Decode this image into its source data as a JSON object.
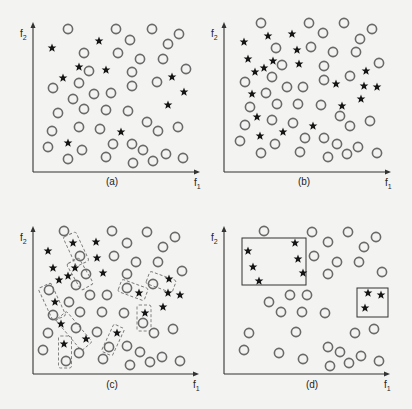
{
  "figure": {
    "panels": [
      {
        "id": "a",
        "caption": "(a)",
        "caption_pos": [
          112,
          185
        ],
        "axes": {
          "x0": 33,
          "y0": 172,
          "xend": 200,
          "ytop": 22,
          "xlabel": "f",
          "xlabel_sub": "1",
          "ylabel": "f",
          "ylabel_sub": "2"
        },
        "circles": [
          [
            68,
            29
          ],
          [
            116,
            29
          ],
          [
            152,
            29
          ],
          [
            179,
            34
          ],
          [
            130,
            40
          ],
          [
            168,
            44
          ],
          [
            84,
            53
          ],
          [
            118,
            53
          ],
          [
            140,
            59
          ],
          [
            163,
            59
          ],
          [
            186,
            69
          ],
          [
            89,
            71
          ],
          [
            132,
            72
          ],
          [
            53,
            88
          ],
          [
            79,
            83
          ],
          [
            132,
            86
          ],
          [
            157,
            82
          ],
          [
            94,
            94
          ],
          [
            111,
            93
          ],
          [
            73,
            99
          ],
          [
            58,
            113
          ],
          [
            84,
            109
          ],
          [
            106,
            110
          ],
          [
            128,
            111
          ],
          [
            147,
            122
          ],
          [
            52,
            131
          ],
          [
            79,
            127
          ],
          [
            100,
            129
          ],
          [
            158,
            131
          ],
          [
            178,
            127
          ],
          [
            48,
            147
          ],
          [
            82,
            150
          ],
          [
            113,
            144
          ],
          [
            132,
            144
          ],
          [
            143,
            150
          ],
          [
            68,
            159
          ],
          [
            106,
            157
          ],
          [
            133,
            163
          ],
          [
            153,
            161
          ],
          [
            166,
            154
          ],
          [
            183,
            158
          ]
        ],
        "stars": [
          [
            52,
            48
          ],
          [
            99,
            41
          ],
          [
            79,
            67
          ],
          [
            106,
            70
          ],
          [
            63,
            78
          ],
          [
            172,
            77
          ],
          [
            184,
            92
          ],
          [
            168,
            105
          ],
          [
            121,
            132
          ],
          [
            68,
            143
          ]
        ],
        "boxes": [],
        "dashed_boxes": []
      },
      {
        "id": "b",
        "caption": "(b)",
        "caption_pos": [
          304,
          185
        ],
        "axes": {
          "x0": 224,
          "y0": 172,
          "xend": 391,
          "ytop": 22,
          "xlabel": "f",
          "xlabel_sub": "1",
          "ylabel": "f",
          "ylabel_sub": "2"
        },
        "circles": [
          [
            261,
            23
          ],
          [
            309,
            23
          ],
          [
            344,
            23
          ],
          [
            372,
            29
          ],
          [
            323,
            33
          ],
          [
            360,
            39
          ],
          [
            276,
            48
          ],
          [
            311,
            47
          ],
          [
            333,
            52
          ],
          [
            356,
            52
          ],
          [
            379,
            63
          ],
          [
            282,
            65
          ],
          [
            324,
            66
          ],
          [
            245,
            82
          ],
          [
            272,
            77
          ],
          [
            324,
            80
          ],
          [
            350,
            76
          ],
          [
            287,
            87
          ],
          [
            303,
            87
          ],
          [
            266,
            93
          ],
          [
            250,
            107
          ],
          [
            277,
            104
          ],
          [
            298,
            104
          ],
          [
            321,
            105
          ],
          [
            340,
            116
          ],
          [
            245,
            125
          ],
          [
            272,
            120
          ],
          [
            293,
            123
          ],
          [
            350,
            126
          ],
          [
            370,
            121
          ],
          [
            240,
            141
          ],
          [
            275,
            144
          ],
          [
            305,
            138
          ],
          [
            324,
            138
          ],
          [
            337,
            144
          ],
          [
            261,
            153
          ],
          [
            300,
            152
          ],
          [
            328,
            157
          ],
          [
            347,
            154
          ],
          [
            358,
            147
          ],
          [
            377,
            153
          ]
        ],
        "stars": [
          [
            244,
            42
          ],
          [
            268,
            36
          ],
          [
            292,
            34
          ],
          [
            297,
            50
          ],
          [
            248,
            59
          ],
          [
            273,
            61
          ],
          [
            299,
            64
          ],
          [
            264,
            68
          ],
          [
            255,
            72
          ],
          [
            366,
            71
          ],
          [
            336,
            84
          ],
          [
            364,
            86
          ],
          [
            377,
            87
          ],
          [
            252,
            94
          ],
          [
            361,
            99
          ],
          [
            342,
            106
          ],
          [
            257,
            117
          ],
          [
            313,
            126
          ],
          [
            283,
            132
          ],
          [
            260,
            136
          ]
        ],
        "boxes": [],
        "dashed_boxes": []
      },
      {
        "id": "c",
        "caption": "(c)",
        "caption_pos": [
          112,
          388
        ],
        "axes": {
          "x0": 33,
          "y0": 374,
          "xend": 199,
          "ytop": 226,
          "xlabel": "f",
          "xlabel_sub": "1",
          "ylabel": "f",
          "ylabel_sub": "2"
        },
        "circles": [
          [
            64,
            231
          ],
          [
            112,
            231
          ],
          [
            147,
            232
          ],
          [
            175,
            237
          ],
          [
            127,
            243
          ],
          [
            163,
            247
          ],
          [
            80,
            256
          ],
          [
            114,
            256
          ],
          [
            136,
            262
          ],
          [
            158,
            262
          ],
          [
            182,
            271
          ],
          [
            86,
            274
          ],
          [
            127,
            274
          ],
          [
            49,
            290
          ],
          [
            76,
            285
          ],
          [
            127,
            288
          ],
          [
            153,
            284
          ],
          [
            90,
            295
          ],
          [
            107,
            295
          ],
          [
            69,
            302
          ],
          [
            53,
            315
          ],
          [
            80,
            312
          ],
          [
            102,
            312
          ],
          [
            124,
            313
          ],
          [
            143,
            323
          ],
          [
            48,
            333
          ],
          [
            76,
            328
          ],
          [
            97,
            332
          ],
          [
            154,
            333
          ],
          [
            173,
            329
          ],
          [
            43,
            350
          ],
          [
            79,
            353
          ],
          [
            109,
            347
          ],
          [
            127,
            346
          ],
          [
            140,
            352
          ],
          [
            66,
            361
          ],
          [
            103,
            359
          ],
          [
            130,
            365
          ],
          [
            150,
            362
          ],
          [
            162,
            357
          ],
          [
            180,
            361
          ]
        ],
        "stars": [
          [
            48,
            251
          ],
          [
            73,
            243
          ],
          [
            96,
            242
          ],
          [
            97,
            258
          ],
          [
            53,
            268
          ],
          [
            75,
            268
          ],
          [
            103,
            273
          ],
          [
            68,
            276
          ],
          [
            59,
            280
          ],
          [
            169,
            279
          ],
          [
            139,
            293
          ],
          [
            168,
            293
          ],
          [
            180,
            295
          ],
          [
            55,
            302
          ],
          [
            163,
            307
          ],
          [
            145,
            313
          ],
          [
            61,
            324
          ],
          [
            117,
            333
          ],
          [
            86,
            339
          ],
          [
            64,
            344
          ]
        ],
        "boxes": [],
        "dashed_boxes": [
          {
            "cx": 76,
            "cy": 249,
            "w": 14,
            "h": 32,
            "rot": -25
          },
          {
            "cx": 80,
            "cy": 274,
            "w": 14,
            "h": 30,
            "rot": -30
          },
          {
            "cx": 52,
            "cy": 302,
            "w": 14,
            "h": 36,
            "rot": -25
          },
          {
            "cx": 74,
            "cy": 331,
            "w": 14,
            "h": 40,
            "rot": -40
          },
          {
            "cx": 65,
            "cy": 352,
            "w": 13,
            "h": 32,
            "rot": 0
          },
          {
            "cx": 133,
            "cy": 290,
            "w": 13,
            "h": 28,
            "rot": -70
          },
          {
            "cx": 161,
            "cy": 282,
            "w": 13,
            "h": 28,
            "rot": -70
          },
          {
            "cx": 144,
            "cy": 318,
            "w": 14,
            "h": 26,
            "rot": 0
          },
          {
            "cx": 113,
            "cy": 340,
            "w": 12,
            "h": 30,
            "rot": 25
          }
        ]
      },
      {
        "id": "d",
        "caption": "(d)",
        "caption_pos": [
          312,
          388
        ],
        "axes": {
          "x0": 224,
          "y0": 374,
          "xend": 390,
          "ytop": 226,
          "xlabel": "f",
          "xlabel_sub": "1",
          "ylabel": "f",
          "ylabel_sub": "2"
        },
        "circles": [
          [
            264,
            231
          ],
          [
            312,
            232
          ],
          [
            348,
            232
          ],
          [
            376,
            237
          ],
          [
            328,
            242
          ],
          [
            364,
            247
          ],
          [
            314,
            256
          ],
          [
            337,
            262
          ],
          [
            359,
            262
          ],
          [
            382,
            272
          ],
          [
            328,
            274
          ],
          [
            290,
            295
          ],
          [
            307,
            295
          ],
          [
            269,
            302
          ],
          [
            281,
            312
          ],
          [
            302,
            312
          ],
          [
            325,
            313
          ],
          [
            249,
            333
          ],
          [
            296,
            332
          ],
          [
            355,
            333
          ],
          [
            374,
            329
          ],
          [
            244,
            350
          ],
          [
            279,
            353
          ],
          [
            328,
            347
          ],
          [
            340,
            352
          ],
          [
            303,
            359
          ],
          [
            330,
            366
          ],
          [
            349,
            363
          ],
          [
            361,
            356
          ],
          [
            379,
            361
          ]
        ],
        "stars": [
          [
            248,
            251
          ],
          [
            295,
            243
          ],
          [
            253,
            267
          ],
          [
            298,
            259
          ],
          [
            259,
            281
          ],
          [
            303,
            273
          ],
          [
            368,
            293
          ],
          [
            381,
            295
          ],
          [
            365,
            308
          ]
        ],
        "boxes": [
          {
            "x": 242,
            "y": 238,
            "w": 64,
            "h": 47
          },
          {
            "x": 357,
            "y": 288,
            "w": 31,
            "h": 29
          }
        ],
        "dashed_boxes": []
      }
    ]
  },
  "legend_semantics": {
    "circle-marker": "class 1 sample (open circle)",
    "star-marker": "class 2 sample (filled star)"
  },
  "colors": {
    "background": "#f3f3f1",
    "circle_stroke": "#6a6a6a",
    "star_fill": "#151515",
    "axis": "#333333"
  }
}
